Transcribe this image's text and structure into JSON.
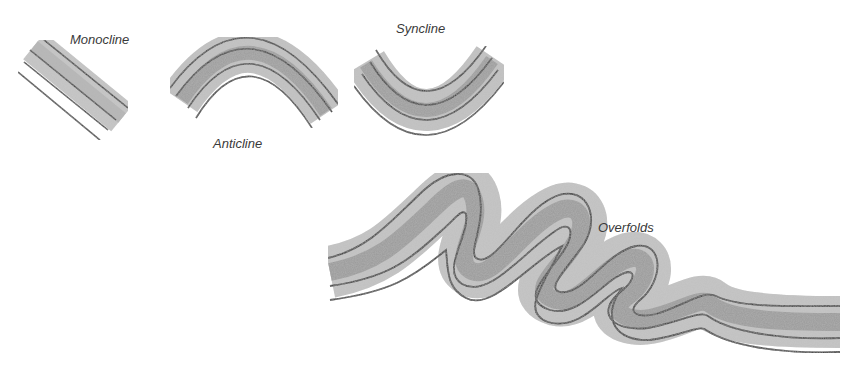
{
  "figure": {
    "labels": {
      "monocline": "Monocline",
      "anticline": "Anticline",
      "syncline": "Syncline",
      "overfolds": "Overfolds"
    }
  },
  "style": {
    "background": "#ffffff",
    "outline_color": "#2a2a2a",
    "layer_light": "#cfcfcf",
    "layer_mid": "#a9a9a9",
    "layer_dark": "#8a8a8a",
    "label_color": "#3a3a3a"
  },
  "icons": [
    "monocline-illustration",
    "anticline-illustration",
    "syncline-illustration",
    "overfold-illustration"
  ]
}
